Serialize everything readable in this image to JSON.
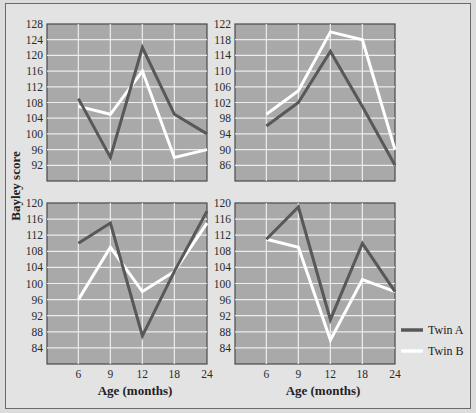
{
  "chart_data": [
    {
      "type": "line",
      "panel": "top-left",
      "x": [
        6,
        9,
        12,
        18,
        24
      ],
      "ylim": [
        88,
        128
      ],
      "yticks": [
        128,
        124,
        120,
        116,
        112,
        108,
        104,
        100,
        96,
        92
      ],
      "xticks": [],
      "series": [
        {
          "name": "Twin A",
          "values": [
            109,
            94,
            122,
            105,
            100
          ]
        },
        {
          "name": "Twin B",
          "values": [
            107,
            105,
            116,
            94,
            96
          ]
        }
      ]
    },
    {
      "type": "line",
      "panel": "top-right",
      "x": [
        6,
        9,
        12,
        18,
        24
      ],
      "ylim": [
        82,
        122
      ],
      "yticks": [
        122,
        118,
        114,
        110,
        106,
        102,
        98,
        94,
        90,
        86
      ],
      "xticks": [],
      "series": [
        {
          "name": "Twin A",
          "values": [
            96,
            102,
            115,
            101,
            86
          ]
        },
        {
          "name": "Twin B",
          "values": [
            99,
            105,
            120,
            118,
            90
          ]
        }
      ]
    },
    {
      "type": "line",
      "panel": "bottom-left",
      "x": [
        6,
        9,
        12,
        18,
        24
      ],
      "ylim": [
        80,
        120
      ],
      "yticks": [
        120,
        116,
        112,
        108,
        104,
        100,
        96,
        92,
        88,
        84
      ],
      "xticks": [
        "6",
        "9",
        "12",
        "18",
        "24"
      ],
      "xlabel": "Age (months)",
      "series": [
        {
          "name": "Twin A",
          "values": [
            110,
            115,
            87,
            103,
            118
          ]
        },
        {
          "name": "Twin B",
          "values": [
            96,
            109,
            98,
            103,
            115
          ]
        }
      ]
    },
    {
      "type": "line",
      "panel": "bottom-right",
      "x": [
        6,
        9,
        12,
        18,
        24
      ],
      "ylim": [
        80,
        120
      ],
      "yticks": [
        120,
        116,
        112,
        108,
        104,
        100,
        96,
        92,
        88,
        84
      ],
      "xticks": [
        "6",
        "9",
        "12",
        "18",
        "24"
      ],
      "xlabel": "Age (months)",
      "series": [
        {
          "name": "Twin A",
          "values": [
            111,
            119,
            91,
            110,
            98
          ]
        },
        {
          "name": "Twin B",
          "values": [
            111,
            109,
            86,
            101,
            98
          ]
        }
      ]
    }
  ],
  "ylabel": "Bayley score",
  "legend": [
    {
      "name": "Twin A",
      "color": "#585858"
    },
    {
      "name": "Twin B",
      "color": "#ffffff"
    }
  ],
  "colors": {
    "plot_bg": "#a9a9a9",
    "grid": "#ececec",
    "twin_a": "#585858",
    "twin_b": "#ffffff"
  }
}
